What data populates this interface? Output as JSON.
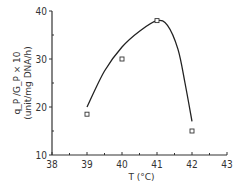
{
  "chart_data": {
    "type": "scatter",
    "title": "",
    "xlabel": "T (°C)",
    "ylabel_line1": "q_P /G_P × 10",
    "ylabel_line2": "(unit/mg DNA/h)",
    "xlim": [
      38,
      43
    ],
    "ylim": [
      10,
      40
    ],
    "x_ticks": [
      38,
      39,
      40,
      41,
      42,
      43
    ],
    "y_ticks": [
      10,
      20,
      30,
      40
    ],
    "grid": false,
    "legend": null,
    "series": [
      {
        "name": "measured",
        "marker": "square",
        "x": [
          39,
          40,
          41,
          42
        ],
        "y": [
          18.5,
          30,
          38,
          15
        ]
      },
      {
        "name": "fitted curve",
        "style": "line",
        "x": [
          39,
          39.5,
          40,
          40.5,
          41,
          41.3,
          41.6,
          41.8,
          42
        ],
        "y": [
          20,
          27.5,
          32.5,
          35.8,
          38,
          37,
          32,
          25,
          17
        ]
      }
    ]
  }
}
